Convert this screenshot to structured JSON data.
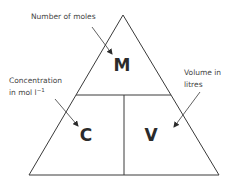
{
  "diagram": {
    "type": "formula-triangle",
    "cells": {
      "top": "M",
      "bottom_left": "C",
      "bottom_right": "V"
    },
    "annotations": {
      "moles": "Number of moles",
      "concentration_line1": "Concentration",
      "concentration_line2": "in mol l",
      "concentration_superscript": "−1",
      "volume_line1": "Volume in",
      "volume_line2": "litres"
    },
    "colors": {
      "line": "#3a3a3a",
      "text": "#444444",
      "letters": "#2b2b2b"
    }
  }
}
